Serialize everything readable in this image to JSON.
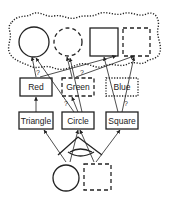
{
  "diagram": {
    "background": "#ffffff",
    "stroke_color": "#222222",
    "top_shapes": [
      {
        "id": "circle-solid",
        "shape": "circle",
        "style": "solid"
      },
      {
        "id": "circle-dashed",
        "shape": "circle",
        "style": "dashed"
      },
      {
        "id": "square-solid",
        "shape": "square",
        "style": "solid"
      },
      {
        "id": "square-dashed",
        "shape": "square",
        "style": "dashed"
      }
    ],
    "cloud_outline": {
      "style": "dotted",
      "encloses": "top_shapes"
    },
    "color_nodes": [
      {
        "label": "Red",
        "border": "solid"
      },
      {
        "label": "Green",
        "border": "dashed"
      },
      {
        "label": "Blue",
        "border": "dotted"
      }
    ],
    "shape_nodes": [
      {
        "label": "Triangle",
        "border": "solid"
      },
      {
        "label": "Circle",
        "border": "solid"
      },
      {
        "label": "Square",
        "border": "solid"
      }
    ],
    "bottom_shapes": [
      {
        "id": "bottom-circle",
        "shape": "circle",
        "style": "solid"
      },
      {
        "id": "bottom-square",
        "shape": "square",
        "style": "dashed"
      }
    ],
    "uncertain_marker": "?",
    "question_marks": [
      "?",
      "?",
      "?",
      "?",
      "?"
    ]
  }
}
